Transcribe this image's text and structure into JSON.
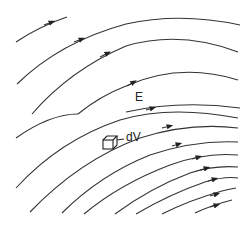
{
  "diagram": {
    "labels": {
      "field": "E",
      "volume_element": "dV"
    },
    "field_lines": {
      "count": 11,
      "direction": "toward upper-right",
      "arrows_per_line": 1,
      "color": "#333333"
    },
    "volume_element_shape": "cube"
  }
}
